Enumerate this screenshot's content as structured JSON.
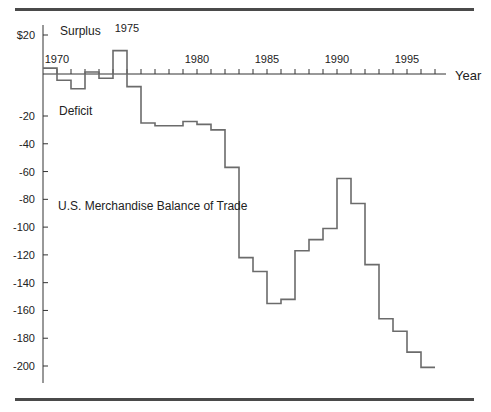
{
  "chart_data": {
    "type": "line",
    "subtype": "step",
    "title": "",
    "xlabel": "Year",
    "ylabel": "",
    "x": [
      1970,
      1971,
      1972,
      1973,
      1974,
      1975,
      1976,
      1977,
      1978,
      1979,
      1980,
      1981,
      1982,
      1983,
      1984,
      1985,
      1986,
      1987,
      1988,
      1989,
      1990,
      1991,
      1992,
      1993,
      1994,
      1995,
      1996,
      1997
    ],
    "series": [
      {
        "name": "U.S. Merchandise Balance of Trade",
        "values": [
          3,
          -3,
          -7,
          1,
          -2,
          12,
          -6,
          -25,
          -27,
          -27,
          -24,
          -26,
          -30,
          -57,
          -122,
          -132,
          -155,
          -152,
          -117,
          -109,
          -101,
          -65,
          -83,
          -127,
          -166,
          -175,
          -190,
          -201
        ]
      }
    ],
    "x_tick_labels": [
      "1970",
      "1975",
      "1980",
      "1985",
      "1990",
      "1995"
    ],
    "y_tick_labels": [
      "$20",
      "-20",
      "-40",
      "-60",
      "-80",
      "-100",
      "-120",
      "-140",
      "-160",
      "-180",
      "-200"
    ],
    "y_ticks": [
      20,
      -20,
      -40,
      -60,
      -80,
      -100,
      -120,
      -140,
      -160,
      -180,
      -200
    ],
    "ylim": [
      -210,
      25
    ],
    "xlim": [
      1970,
      1998
    ],
    "annotations": [
      "Surplus",
      "Deficit",
      "U.S. Merchandise Balance of Trade"
    ],
    "grid": false,
    "legend": "none"
  },
  "labels": {
    "surplus": "Surplus",
    "deficit": "Deficit",
    "series_label": "U.S. Merchandise Balance of Trade",
    "x_axis_title": "Year"
  },
  "colors": {
    "line": "#6b6b6b",
    "axis": "#333333",
    "rule": "#4a4a4a"
  }
}
